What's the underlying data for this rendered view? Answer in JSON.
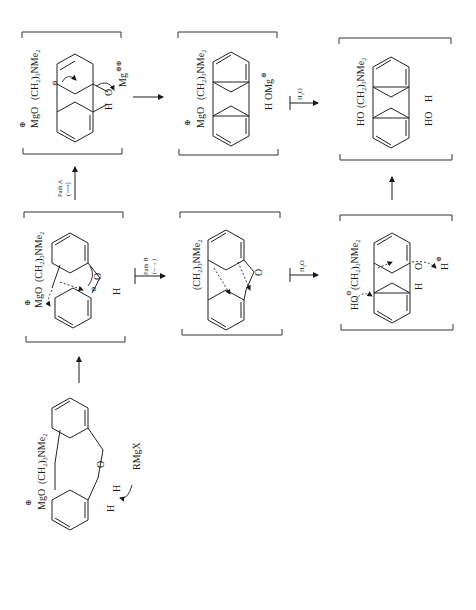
{
  "diagram": {
    "type": "reaction-mechanism",
    "orientation": "rotated-90-ccw",
    "starting_material": {
      "labels": [
        "MgO",
        "(CH2)3NMe2",
        "H",
        "H",
        "O",
        "RMgX"
      ],
      "charge": "⊕"
    },
    "intermediates": [
      {
        "id": "I1",
        "labels": [
          "MgO",
          "(CH2)3NMe2",
          "O",
          "H"
        ],
        "charges": [
          "⊕",
          "⊖"
        ]
      },
      {
        "id": "I2-pathA",
        "labels": [
          "MgO",
          "(CH2)3NMe2",
          "O",
          "H",
          "Mg"
        ],
        "charges": [
          "⊕",
          "⊖",
          "⊕⊕"
        ]
      },
      {
        "id": "I3-pathA",
        "labels": [
          "MgO",
          "(CH2)3NMe2",
          "H",
          "OMg"
        ],
        "charges": [
          "⊕",
          "⊕"
        ]
      },
      {
        "id": "I2-pathB",
        "labels": [
          "(CH2)3NMe2",
          "O"
        ]
      },
      {
        "id": "I3-pathB",
        "labels": [
          "HO",
          "(CH2)3NMe2",
          "O",
          "H",
          "H"
        ],
        "charges": [
          "⊖",
          "⊕"
        ]
      }
    ],
    "product": {
      "labels": [
        "HO",
        "(CH2)3NMe2",
        "HO",
        "H"
      ]
    },
    "arrows": [
      {
        "from": "starting_material",
        "to": "I1",
        "label": ""
      },
      {
        "from": "I1",
        "to": "I2-pathA",
        "label": "Path A",
        "sublabel": "(⟶)"
      },
      {
        "from": "I1",
        "to": "I2-pathB",
        "label": "Path B",
        "sublabel": "(--→)"
      },
      {
        "from": "I2-pathA",
        "to": "I3-pathA",
        "label": ""
      },
      {
        "from": "I3-pathA",
        "to": "product",
        "label": "H2O"
      },
      {
        "from": "I2-pathB",
        "to": "I3-pathB",
        "label": "H2O"
      },
      {
        "from": "I3-pathB",
        "to": "product",
        "label": ""
      }
    ],
    "text": {
      "mgo": "MgO",
      "chain": "(CH",
      "chain_sub2": "2",
      "chain_mid": ")",
      "chain_sub3": "3",
      "chain_end": "NMe",
      "chain_sub_end": "2",
      "plus": "⊕",
      "minus": "⊖",
      "plusplus": "⊕⊕",
      "h": "H",
      "o": "O",
      "ho": "HO",
      "omg": "OMg",
      "mg": "Mg",
      "rmgx": "RMgX",
      "path_a": "Path A",
      "path_a_sub": "(⟶)",
      "path_b": "Path B",
      "path_b_sub": "(--→)",
      "h2o": "H",
      "h2o_sub": "2",
      "h2o_end": "O"
    }
  }
}
